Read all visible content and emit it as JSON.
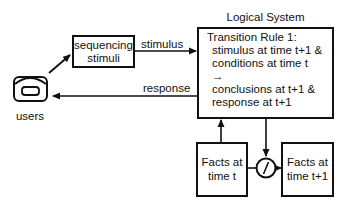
{
  "diagram": {
    "title": "Logical System",
    "nodes": {
      "users": {
        "label": "users",
        "icon": "telephone-icon"
      },
      "sequencing": {
        "line1": "sequencing",
        "line2": "stimuli"
      },
      "logical_system": {
        "heading": "Transition Rule 1:",
        "lines": [
          "stimulus at time t+1 &",
          "conditions at time t",
          "→",
          "conclusions at t+1 &",
          "response at t+1"
        ]
      },
      "facts_t": {
        "line1": "Facts at",
        "line2": "time t"
      },
      "facts_t1": {
        "line1": "Facts at",
        "line2": "time t+1"
      },
      "update_operator": {
        "icon": "slash-circle-icon"
      }
    },
    "edges": [
      {
        "from": "users",
        "to": "sequencing",
        "label": ""
      },
      {
        "from": "sequencing",
        "to": "logical_system",
        "label": "stimulus"
      },
      {
        "from": "logical_system",
        "to": "users",
        "label": "response"
      },
      {
        "from": "facts_t",
        "to": "logical_system",
        "label": ""
      },
      {
        "from": "logical_system",
        "to": "update_operator",
        "label": ""
      },
      {
        "from": "facts_t",
        "to": "update_operator",
        "label": ""
      },
      {
        "from": "update_operator",
        "to": "facts_t1",
        "label": ""
      }
    ],
    "edge_labels": {
      "stimulus": "stimulus",
      "response": "response"
    }
  }
}
